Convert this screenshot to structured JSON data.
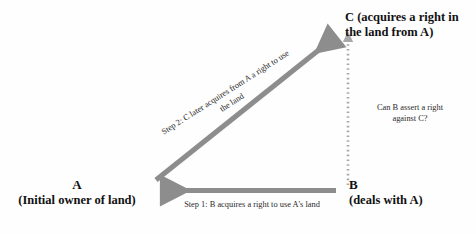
{
  "diagram": {
    "background_color": "#fefefe",
    "arrow_color": "#8d8d8d",
    "text_color": "#1a1a1a",
    "nodes": [
      {
        "id": "A",
        "letter": "A",
        "description": "(Initial owner of land)",
        "position": "bottom-left"
      },
      {
        "id": "B",
        "letter": "B",
        "description": "(deals with A)",
        "position": "bottom-right"
      },
      {
        "id": "C",
        "letter": "C (acquires a right in",
        "description": "the land from A)",
        "position": "top-right"
      }
    ],
    "edges": [
      {
        "id": "step1",
        "from": "B",
        "to": "A",
        "style": "solid-arrow",
        "direction": "right-to-left",
        "label": "Step 1: B acquires a right to use A's land"
      },
      {
        "id": "step2",
        "from": "A",
        "to": "C",
        "style": "solid-arrow",
        "direction": "diagonal-up-right",
        "label_line1": "Step 2: C later acquires from A a right to use",
        "label_line2": "the land"
      },
      {
        "id": "question",
        "from": "B",
        "to": "C",
        "style": "dotted-arrow",
        "direction": "bottom-to-top",
        "label_line1": "Can B assert a right",
        "label_line2": "against C?"
      }
    ]
  }
}
